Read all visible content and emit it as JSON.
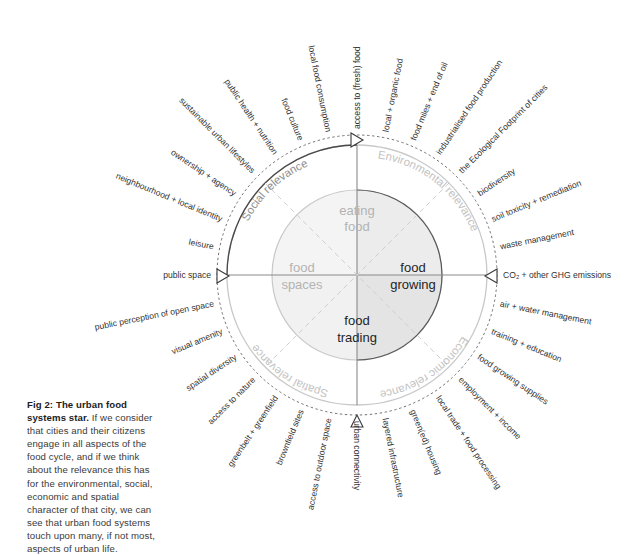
{
  "figure": {
    "caption_lead": "Fig 2: The urban food systems star.",
    "caption_body": " If we consider that cities and their citizens engage in all aspects of the food cycle, and if we think about the relevance this has for the environmental, social, economic and spatial character of that city, we can see that urban food systems touch upon many, if not most, aspects of urban life."
  },
  "core": {
    "top": "eating\nfood",
    "top_line1": "eating",
    "top_line2": "food",
    "right_line1": "food",
    "right_line2": "growing",
    "bottom_line1": "food",
    "bottom_line2": "trading",
    "left_line1": "food",
    "left_line2": "spaces"
  },
  "quadrants": [
    {
      "name": "social",
      "label": "Social relevance",
      "tone": "dark"
    },
    {
      "name": "environmental",
      "label": "Environmental relevance",
      "tone": "light"
    },
    {
      "name": "economic",
      "label": "Economic relevance",
      "tone": "light"
    },
    {
      "name": "spatial",
      "label": "Spatial relevance",
      "tone": "light"
    }
  ],
  "cardinal_markers": [
    {
      "name": "north",
      "label": "access to (fresh) food"
    },
    {
      "name": "east",
      "label": "CO₂ + other GHG emissions"
    },
    {
      "name": "south",
      "label": "urban connectivity"
    },
    {
      "name": "west",
      "label": "public space"
    }
  ],
  "spokes": [
    {
      "angle": -90,
      "label": "access to (fresh) food",
      "cardinal": true
    },
    {
      "angle": -75,
      "label": "local + organic food",
      "cardinal": false
    },
    {
      "angle": -60,
      "label": "food miles + end of oil",
      "cardinal": false
    },
    {
      "angle": -45,
      "label": "industrialised food production",
      "cardinal": false
    },
    {
      "angle": -30,
      "label": "the Ecological Footprint of cities",
      "cardinal": false
    },
    {
      "angle": -15,
      "label": "biodiversity",
      "cardinal": false
    },
    {
      "angle": 0,
      "label": "soil toxicity + remediation",
      "cardinal": false
    },
    {
      "angle": 0,
      "label": "waste management",
      "cardinal": false
    },
    {
      "angle": 0,
      "label": "CO₂ + other GHG emissions",
      "cardinal": true
    },
    {
      "angle": 0,
      "label": "air + water management",
      "cardinal": false
    },
    {
      "angle": 0,
      "label": "training + education",
      "cardinal": false
    },
    {
      "angle": 0,
      "label": "food growing supplies",
      "cardinal": false
    },
    {
      "angle": 0,
      "label": "employment + income",
      "cardinal": false
    },
    {
      "angle": 0,
      "label": "local trade + food processing",
      "cardinal": false
    },
    {
      "angle": 0,
      "label": "green(ed) housing",
      "cardinal": false
    },
    {
      "angle": 0,
      "label": "layered infrastructure",
      "cardinal": false
    },
    {
      "angle": 0,
      "label": "urban connectivity",
      "cardinal": true
    },
    {
      "angle": 0,
      "label": "access to outdoor space",
      "cardinal": false
    },
    {
      "angle": 0,
      "label": "brownfield sites",
      "cardinal": false
    },
    {
      "angle": 0,
      "label": "greenbelt + greenfield",
      "cardinal": false
    },
    {
      "angle": 0,
      "label": "access to nature",
      "cardinal": false
    },
    {
      "angle": 0,
      "label": "spatial diversity",
      "cardinal": false
    },
    {
      "angle": 0,
      "label": "visual amenity",
      "cardinal": false
    },
    {
      "angle": 0,
      "label": "public perception of open space",
      "cardinal": false
    },
    {
      "angle": 0,
      "label": "public space",
      "cardinal": true
    },
    {
      "angle": 0,
      "label": "leisure",
      "cardinal": false
    },
    {
      "angle": 0,
      "label": "neighbourhood + local identity",
      "cardinal": false
    },
    {
      "angle": 0,
      "label": "ownership + agency",
      "cardinal": false
    },
    {
      "angle": 0,
      "label": "sustainable urban lifestyles",
      "cardinal": false
    },
    {
      "angle": 0,
      "label": "public health + nutrition",
      "cardinal": false
    },
    {
      "angle": 0,
      "label": "food culture",
      "cardinal": false
    },
    {
      "angle": 0,
      "label": "local food consumption",
      "cardinal": false
    }
  ],
  "colors": {
    "ink": "#2e2e2e",
    "ring_dark": "#4a4a4a",
    "ring_light": "#c8c8c8",
    "core_strong": "#1f1f1f",
    "core_faint": "#b3b3b3",
    "shade_dark": "#e4e4e4",
    "shade_light": "#f2f2f2",
    "background": "#ffffff"
  }
}
